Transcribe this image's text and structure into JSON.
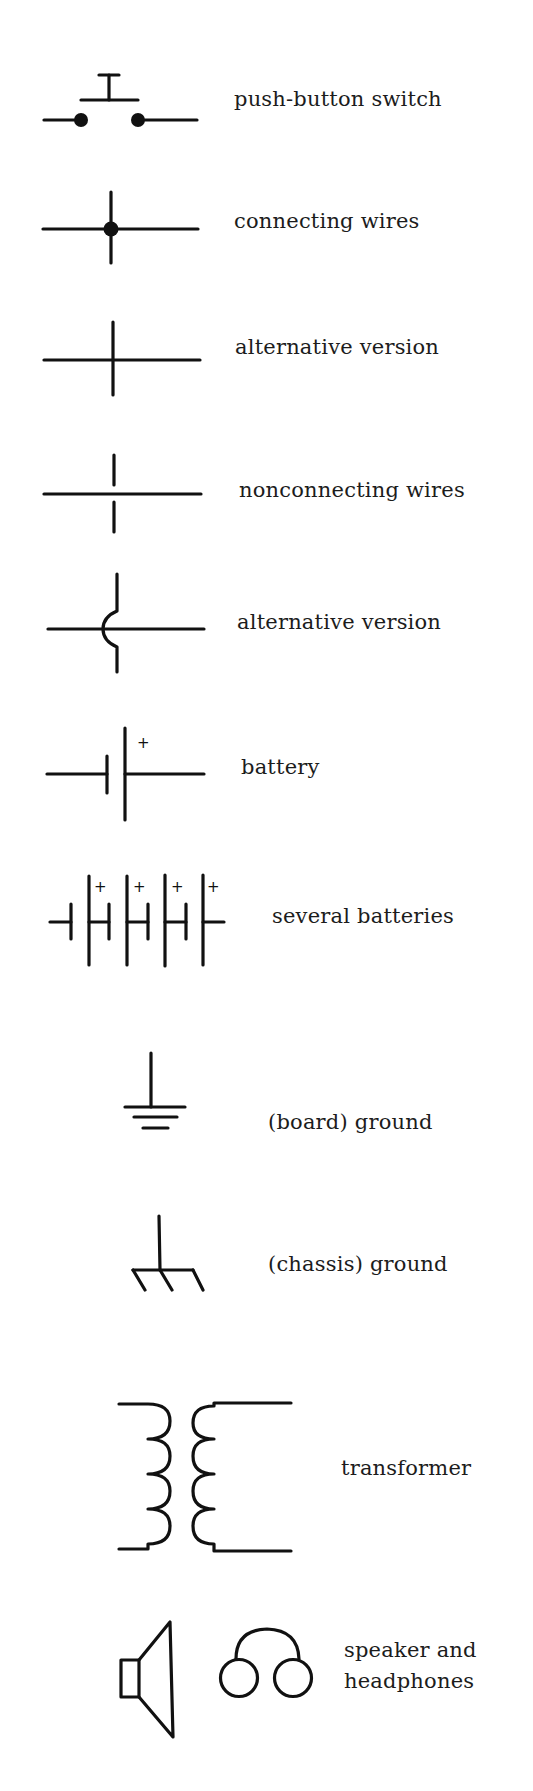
{
  "symbols": [
    {
      "id": "push-button-switch",
      "label": "push-button switch"
    },
    {
      "id": "connecting-wires",
      "label": "connecting wires"
    },
    {
      "id": "connecting-wires-alt",
      "label": "alternative version"
    },
    {
      "id": "nonconnecting-wires",
      "label": "nonconnecting wires"
    },
    {
      "id": "nonconnecting-wires-alt",
      "label": "alternative version"
    },
    {
      "id": "battery",
      "label": "battery",
      "polarity": "+"
    },
    {
      "id": "several-batteries",
      "label": "several batteries",
      "polarity": "+"
    },
    {
      "id": "board-ground",
      "label": "(board) ground"
    },
    {
      "id": "chassis-ground",
      "label": "(chassis) ground"
    },
    {
      "id": "transformer",
      "label": "transformer"
    },
    {
      "id": "speaker-headphones",
      "label_line1": "speaker and",
      "label_line2": "headphones"
    }
  ]
}
